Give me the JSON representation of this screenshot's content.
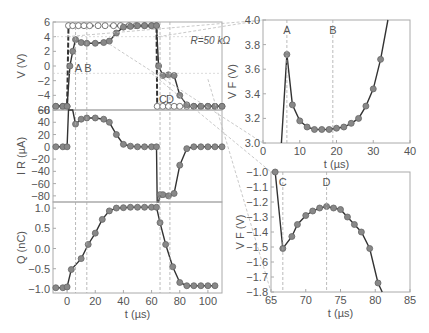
{
  "figure": {
    "annotation_R": "R=50 kΩ",
    "markers": {
      "A": "A",
      "B": "B",
      "C": "C",
      "D": "D"
    },
    "colors": {
      "line": "#333333",
      "dot": "#888888",
      "frame": "#aaaaaa",
      "dash": "#aaaaaa",
      "text": "#555555"
    }
  },
  "chart_data": [
    {
      "id": "V_panel",
      "type": "line",
      "ylabel": "V (V)",
      "xlabel": "",
      "xlim": [
        -10,
        110
      ],
      "ylim": [
        -6,
        6
      ],
      "yticks": [
        6,
        4,
        2,
        0,
        -2,
        -4,
        -6
      ],
      "annotation": "R=50 kΩ",
      "series": [
        {
          "name": "Applied voltage (open circles, dashed)",
          "x": [
            -8,
            -3,
            0,
            1,
            4,
            8,
            12,
            16,
            22,
            27,
            33,
            38,
            44,
            49,
            55,
            60,
            63.5,
            64,
            68,
            72,
            76,
            80,
            85,
            90,
            95,
            100,
            105,
            110
          ],
          "y": [
            -5.5,
            -5.5,
            -5.5,
            5.5,
            5.5,
            5.5,
            5.5,
            5.5,
            5.5,
            5.5,
            5.5,
            5.5,
            5.5,
            5.5,
            5.5,
            5.5,
            5.5,
            -5.5,
            -5.5,
            -5.5,
            -5.5,
            -5.5,
            -5.5,
            -5.5,
            -5.5,
            -5.5,
            -5.5,
            -5.5
          ]
        },
        {
          "name": "Ferroelectric voltage (filled dots, solid)",
          "x": [
            -8,
            -3,
            0,
            2,
            4,
            6,
            10,
            14,
            20,
            26,
            30,
            35,
            40,
            45,
            50,
            55,
            60,
            63.5,
            65,
            68,
            72,
            76,
            80,
            85,
            90,
            95,
            100,
            105,
            110
          ],
          "y": [
            -5.5,
            -5.5,
            -5.5,
            0,
            2,
            3.6,
            3.2,
            3.1,
            3.1,
            3.2,
            3.4,
            4.5,
            5.3,
            5.4,
            5.5,
            5.5,
            5.5,
            5.5,
            0,
            -1.3,
            -1.2,
            -1.3,
            -4,
            -5.3,
            -5.5,
            -5.5,
            -5.5,
            -5.5,
            -5.5
          ]
        }
      ],
      "vlines": {
        "A": 6,
        "B": 14,
        "C": 66,
        "D": 73
      }
    },
    {
      "id": "IR_panel",
      "type": "line",
      "ylabel": "I_R (µA)",
      "xlim": [
        -10,
        110
      ],
      "ylim": [
        -90,
        60
      ],
      "yticks": [
        60,
        40,
        20,
        0,
        -20,
        -40,
        -60,
        -80
      ],
      "series": [
        {
          "name": "I_R",
          "x": [
            -8,
            -3,
            0,
            1,
            4,
            6,
            10,
            14,
            20,
            26,
            30,
            35,
            40,
            45,
            50,
            55,
            60,
            63.5,
            64,
            65,
            66,
            68,
            72,
            76,
            80,
            85,
            90,
            95,
            100,
            105,
            110
          ],
          "y": [
            0,
            0,
            0,
            110,
            70,
            37,
            45,
            47,
            47,
            45,
            40,
            20,
            4,
            1,
            0,
            0,
            0,
            0,
            -110,
            -110,
            -78,
            -78,
            -80,
            -76,
            -30,
            -3,
            0,
            0,
            0,
            0,
            0
          ]
        }
      ]
    },
    {
      "id": "Q_panel",
      "type": "line",
      "ylabel": "Q (nC)",
      "xlabel": "t (µs)",
      "xlim": [
        -10,
        110
      ],
      "ylim": [
        -1.1,
        1.15
      ],
      "yticks": [
        1.0,
        0.5,
        0.0,
        -0.5,
        -1.0
      ],
      "xticks": [
        0,
        20,
        40,
        60,
        80,
        100
      ],
      "series": [
        {
          "name": "Q",
          "x": [
            -8,
            -3,
            0,
            3,
            10,
            15,
            20,
            25,
            30,
            35,
            40,
            45,
            50,
            55,
            60,
            63.5,
            66,
            70,
            75,
            80,
            85,
            90,
            95,
            100,
            105
          ],
          "y": [
            -0.97,
            -0.97,
            -0.95,
            -0.52,
            -0.25,
            0.1,
            0.38,
            0.72,
            0.93,
            1.0,
            1.01,
            1.02,
            1.02,
            1.02,
            1.02,
            1.02,
            0.64,
            0.1,
            -0.45,
            -0.84,
            -0.92,
            -0.92,
            -0.92,
            -0.92,
            -0.92
          ]
        }
      ]
    },
    {
      "id": "VF_zoom_AB",
      "type": "line",
      "ylabel": "V_F (V)",
      "xlabel": "t (µs)",
      "xlim": [
        0,
        40
      ],
      "ylim": [
        3.0,
        4.0
      ],
      "xticks": [
        0,
        10,
        20,
        30,
        40
      ],
      "yticks": [
        3.0,
        3.2,
        3.4,
        3.6,
        3.8,
        4.0
      ],
      "vlines": {
        "A": 6.5,
        "B": 19
      },
      "series": [
        {
          "name": "V_F",
          "x": [
            5,
            6.5,
            8,
            10,
            12,
            14,
            16,
            18,
            20,
            22,
            24,
            26,
            28,
            30,
            32,
            34
          ],
          "y": [
            3.0,
            3.72,
            3.31,
            3.18,
            3.13,
            3.11,
            3.11,
            3.11,
            3.12,
            3.13,
            3.16,
            3.2,
            3.3,
            3.44,
            3.68,
            4.0
          ]
        }
      ]
    },
    {
      "id": "VF_zoom_CD",
      "type": "line",
      "ylabel": "V_F (V)",
      "xlabel": "t (µs)",
      "xlim": [
        65,
        85
      ],
      "ylim": [
        -1.8,
        -1.0
      ],
      "xticks": [
        65,
        70,
        75,
        80,
        85
      ],
      "yticks": [
        -1.0,
        -1.1,
        -1.2,
        -1.3,
        -1.4,
        -1.5,
        -1.6,
        -1.7,
        -1.8
      ],
      "vlines": {
        "C": 66.7,
        "D": 73
      },
      "series": [
        {
          "name": "V_F",
          "x": [
            65.6,
            66.7,
            68,
            68.8,
            70,
            71,
            72,
            73,
            74,
            75,
            76,
            77,
            78,
            79.2,
            80.4,
            81
          ],
          "y": [
            -1.0,
            -1.51,
            -1.43,
            -1.35,
            -1.29,
            -1.26,
            -1.24,
            -1.23,
            -1.24,
            -1.25,
            -1.3,
            -1.35,
            -1.4,
            -1.51,
            -1.74,
            -1.8
          ]
        }
      ]
    }
  ]
}
